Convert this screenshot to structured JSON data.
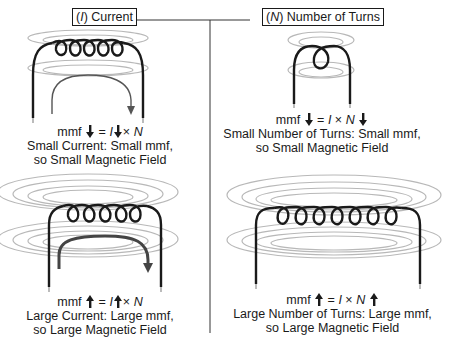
{
  "panels": {
    "left": {
      "header": {
        "symbol": "I",
        "label": "Current"
      },
      "top": {
        "formula": {
          "prefix": "mmf",
          "mmf_arrow": "down",
          "equals": "=",
          "I": "I",
          "I_arrow": "down",
          "times": "×",
          "N": "N",
          "N_arrow": "none"
        },
        "caption_line1": "Small Current: Small mmf,",
        "caption_line2": "so Small Magnetic Field",
        "coil_turns": 5,
        "field_rings": 2,
        "current_arrow": "small"
      },
      "bottom": {
        "formula": {
          "prefix": "mmf",
          "mmf_arrow": "up",
          "equals": "=",
          "I": "I",
          "I_arrow": "up",
          "times": "×",
          "N": "N",
          "N_arrow": "none"
        },
        "caption_line1": "Large Current: Large mmf,",
        "caption_line2": "so Large Magnetic Field",
        "coil_turns": 5,
        "field_rings": 4,
        "current_arrow": "large"
      }
    },
    "right": {
      "header": {
        "symbol": "N",
        "label": "Number of Turns"
      },
      "top": {
        "formula": {
          "prefix": "mmf",
          "mmf_arrow": "down",
          "equals": "=",
          "I": "I",
          "I_arrow": "none",
          "times": "×",
          "N": "N",
          "N_arrow": "down"
        },
        "caption_line1": "Small Number of Turns: Small mmf,",
        "caption_line2": "so Small Magnetic Field",
        "coil_turns": 1,
        "field_rings": 2
      },
      "bottom": {
        "formula": {
          "prefix": "mmf",
          "mmf_arrow": "up",
          "equals": "=",
          "I": "I",
          "I_arrow": "none",
          "times": "×",
          "N": "N",
          "N_arrow": "up"
        },
        "caption_line1": "Large Number of Turns: Large mmf,",
        "caption_line2": "so Large Magnetic Field",
        "coil_turns": 7,
        "field_rings": 4
      }
    }
  },
  "colors": {
    "wire": "#1a1a1a",
    "field_line": "#b8b8b8",
    "current_arrow": "#555555",
    "divider": "#333333"
  }
}
